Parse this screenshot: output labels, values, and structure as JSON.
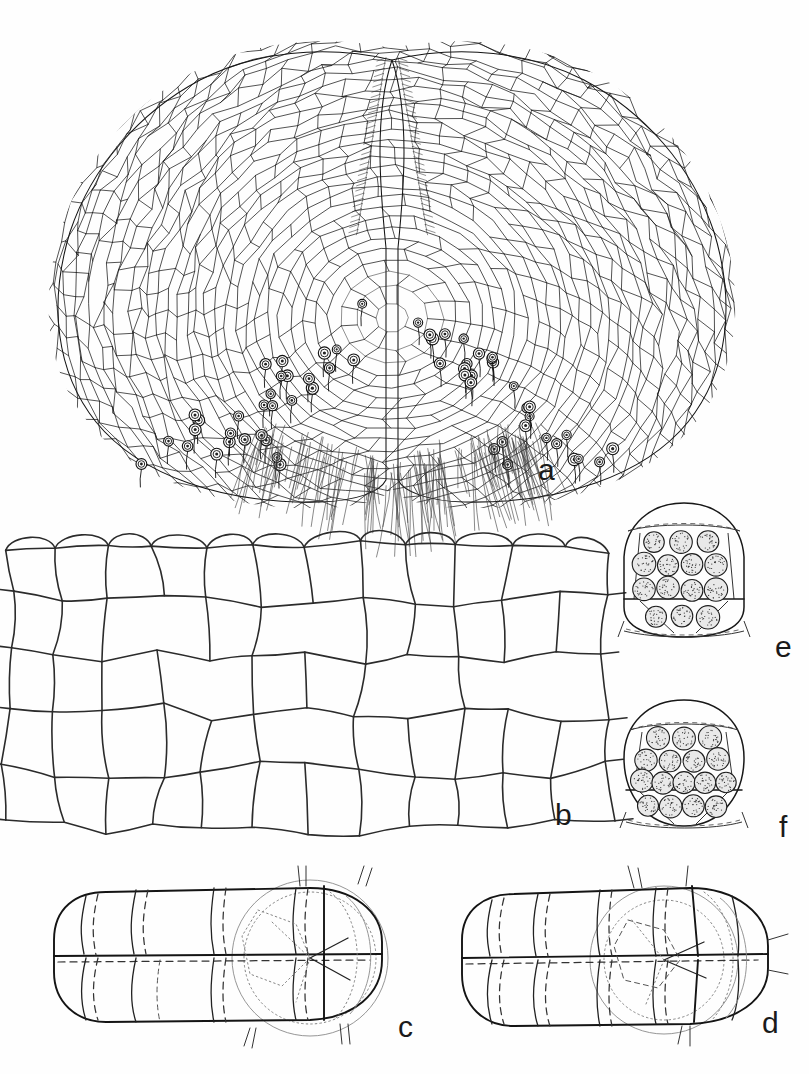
{
  "figure": {
    "kind": "scientific-line-drawing-plate",
    "background_color": "#fefefe",
    "ink_color": "#1a1a1a",
    "width": 809,
    "height": 1074,
    "panel_count": 6
  },
  "panels": [
    {
      "id": "a",
      "label": "a",
      "caption": "cordate gametophyte thallus with apical notch, archegonia and rhizoids",
      "label_x": 538,
      "label_y": 455
    },
    {
      "id": "b",
      "label": "b",
      "caption": "magnified marginal cells of the thallus",
      "label_x": 555,
      "label_y": 800
    },
    {
      "id": "c",
      "label": "c",
      "caption": "multicellular embryo / sporeling in optical section",
      "label_x": 398,
      "label_y": 1012
    },
    {
      "id": "d",
      "label": "d",
      "caption": "multicellular embryo / sporeling in optical section",
      "label_x": 762,
      "label_y": 1008
    },
    {
      "id": "e",
      "label": "e",
      "caption": "sporangium containing spores",
      "label_x": 775,
      "label_y": 632,
      "spore_count": 13
    },
    {
      "id": "f",
      "label": "f",
      "caption": "sporangium containing spores",
      "label_x": 779,
      "label_y": 812,
      "spore_count": 16
    }
  ],
  "chart_data": {
    "type": "table",
    "title": "",
    "categories": [
      "a",
      "b",
      "c",
      "d",
      "e",
      "f"
    ],
    "values": [
      0,
      0,
      0,
      0,
      13,
      16
    ]
  }
}
